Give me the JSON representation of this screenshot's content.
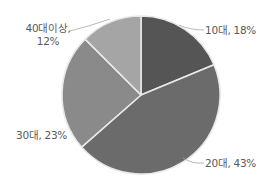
{
  "chart_data": {
    "type": "pie",
    "title": "",
    "start_angle": "12 o'clock",
    "direction": "clockwise",
    "categories": [
      "10대",
      "20대",
      "30대",
      "40대이상"
    ],
    "values": [
      18,
      43,
      23,
      12
    ],
    "unit": "%",
    "colors": [
      "#555555",
      "#6b6b6b",
      "#8a8a8a",
      "#a5a5a5"
    ],
    "labels": [
      {
        "category": "10대",
        "text": "10대, 18%"
      },
      {
        "category": "20대",
        "text": "20대, 43%"
      },
      {
        "category": "30대",
        "text": "30대, 23%"
      },
      {
        "category": "40대이상",
        "text_line1": "40대이상,",
        "text_line2": "12%"
      }
    ],
    "legend": "none",
    "separator_color": "#e8e8e8"
  }
}
